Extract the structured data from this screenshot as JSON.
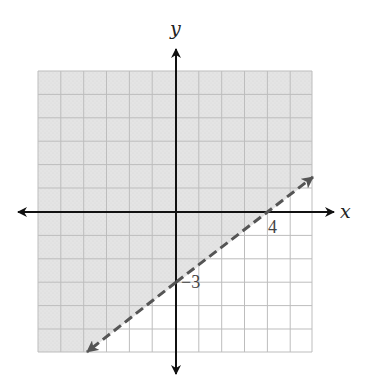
{
  "graph": {
    "type": "linear-inequality-graph",
    "x_axis_label": "x",
    "y_axis_label": "y",
    "x_range": [
      -6,
      6
    ],
    "y_range": [
      -6,
      6
    ],
    "grid": true,
    "boundary_line": {
      "equation": "y = 3/4 x - 3",
      "style": "dashed",
      "x_intercept": 4,
      "y_intercept": -3
    },
    "shaded_region": "above the line",
    "labels": {
      "x_intercept_label": "4",
      "y_intercept_label": "−3"
    },
    "colors": {
      "shade": "#e3e3e3",
      "grid": "#bdbdbd",
      "axis": "#111111",
      "boundary": "#555555"
    }
  }
}
